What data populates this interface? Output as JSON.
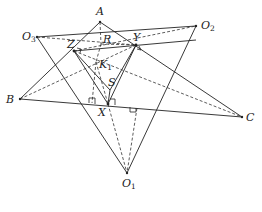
{
  "diagram": {
    "type": "geometry",
    "points": {
      "A": {
        "label": "A",
        "x": 100,
        "y": 22
      },
      "B": {
        "label": "B",
        "x": 20,
        "y": 99
      },
      "C": {
        "label": "C",
        "x": 242,
        "y": 117
      },
      "O1": {
        "label": "O",
        "sub": "1",
        "x": 127,
        "y": 173
      },
      "O2": {
        "label": "O",
        "sub": "2",
        "x": 196,
        "y": 26
      },
      "O3": {
        "label": "O",
        "sub": "3",
        "x": 37,
        "y": 37
      },
      "X": {
        "label": "X",
        "x": 108,
        "y": 104
      },
      "Y": {
        "label": "Y",
        "x": 136,
        "y": 45
      },
      "Z": {
        "label": "Z",
        "x": 74,
        "y": 51
      },
      "R": {
        "label": "R",
        "x": 101,
        "y": 44
      },
      "S": {
        "label": "S",
        "x": 110,
        "y": 90
      },
      "K1": {
        "label": "K",
        "sub": "1",
        "x": 96,
        "y": 62
      }
    },
    "solid_segments": [
      [
        "A",
        "B"
      ],
      [
        "A",
        "C"
      ],
      [
        "B",
        "C"
      ],
      [
        "O3",
        "O2"
      ],
      [
        "O3",
        "O1"
      ],
      [
        "O2",
        "O1"
      ],
      [
        "Z",
        "Y"
      ],
      [
        "Z",
        "X"
      ],
      [
        "Y",
        "X"
      ],
      [
        "Z",
        "S"
      ],
      [
        "Y",
        "S"
      ],
      [
        "S",
        "X"
      ]
    ],
    "dashed_segments": [
      [
        "O3",
        "Y"
      ],
      [
        "Z",
        "O2"
      ],
      [
        "B",
        "Y"
      ],
      [
        "Z",
        "C"
      ],
      [
        "A",
        "X"
      ],
      [
        "X",
        "O1"
      ],
      [
        "K1",
        "O1"
      ],
      [
        "Z",
        "K1"
      ]
    ],
    "right_angle_marks": [
      "Z",
      "Y",
      "X-left",
      "X-right",
      "foot-right"
    ]
  }
}
